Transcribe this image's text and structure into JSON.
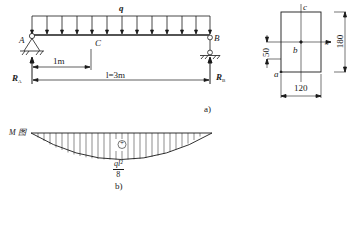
{
  "beam_figure": {
    "load_label": "q",
    "support_a_label": "A",
    "support_b_label": "B",
    "point_c_label": "C",
    "reaction_a": {
      "main": "R",
      "sub": "A"
    },
    "reaction_b": {
      "main": "R",
      "sub": "B"
    },
    "dim_ac": "1m",
    "dim_span": "l=3m",
    "caption": "a)"
  },
  "cross_section": {
    "width": "120",
    "height": "180",
    "offset": "50",
    "point_a": "a",
    "point_b": "b",
    "point_c": "c",
    "axis_label": "z"
  },
  "moment_diagram": {
    "title": "M 图",
    "sign": "+",
    "max_numerator": "ql²",
    "max_denominator": "8",
    "caption": "b)"
  },
  "colors": {
    "line": "#1a1a1a",
    "background": "#ffffff"
  }
}
